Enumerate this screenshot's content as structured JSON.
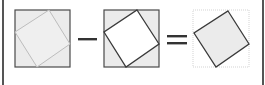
{
  "diagram": {
    "title": "",
    "colors": {
      "fill_gray": "#ebebeb",
      "fill_white": "#ffffff",
      "stroke_dark": "#4a4a4a",
      "stroke_faint": "#bdbdbd",
      "stroke_dotted": "#c8c8c8",
      "border": "#555555"
    },
    "panels": [
      {
        "id": "panel-1",
        "outer_box": {
          "x": 15,
          "y": 10,
          "w": 55,
          "h": 57,
          "style": "solid",
          "fill": "gray"
        },
        "inner_square": {
          "points": "49,10 70,44 37,67 15,32",
          "style": "faint",
          "fill": "gray"
        }
      },
      {
        "id": "panel-2",
        "outer_box": {
          "x": 104,
          "y": 10,
          "w": 55,
          "h": 57,
          "style": "solid",
          "fill": "gray"
        },
        "inner_square": {
          "points": "137,10 159,44 126,67 104,32",
          "style": "dark",
          "fill": "white"
        }
      },
      {
        "id": "panel-3",
        "outer_box": {
          "x": 193,
          "y": 10,
          "w": 56,
          "h": 57,
          "style": "dotted",
          "fill": "none"
        },
        "inner_square": {
          "points": "228,11 249,44 216,67 194,33",
          "style": "dark",
          "fill": "gray"
        }
      }
    ],
    "operators": [
      {
        "symbol": "minus",
        "label": "−"
      },
      {
        "symbol": "equals",
        "label": "="
      }
    ]
  }
}
